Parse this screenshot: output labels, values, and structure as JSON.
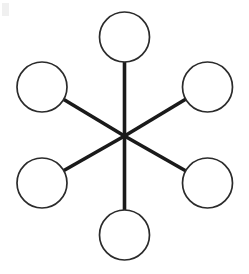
{
  "diagram": {
    "name": "hub-and-spoke-diagram",
    "type": "node-link",
    "canvas": {
      "width": 249,
      "height": 274,
      "background_color": "#ffffff"
    },
    "style": {
      "node_stroke_color": "#2b2b2b",
      "node_fill_color": "#ffffff",
      "node_stroke_width": 1.7,
      "edge_color": "#1a1a1a",
      "edge_width": 3.6,
      "hub_edge_width": 3.6
    },
    "hub": {
      "label": "",
      "name": "hub-center",
      "cx": 124.5,
      "cy": 136.0
    },
    "nodes": [
      {
        "id": "node-top",
        "label": "",
        "position": "top",
        "cx": 124.5,
        "cy": 37.0,
        "r": 25.0
      },
      {
        "id": "node-upper-right",
        "label": "",
        "position": "upper-right",
        "cx": 207.5,
        "cy": 87.0,
        "r": 25.0
      },
      {
        "id": "node-lower-right",
        "label": "",
        "position": "lower-right",
        "cx": 207.5,
        "cy": 183.0,
        "r": 25.0
      },
      {
        "id": "node-bottom",
        "label": "",
        "position": "bottom",
        "cx": 124.5,
        "cy": 235.0,
        "r": 25.0
      },
      {
        "id": "node-lower-left",
        "label": "",
        "position": "lower-left",
        "cx": 42.0,
        "cy": 183.0,
        "r": 25.0
      },
      {
        "id": "node-upper-left",
        "label": "",
        "position": "upper-left",
        "cx": 42.0,
        "cy": 87.0,
        "r": 25.0
      }
    ],
    "edges": [
      {
        "id": "edge-hub-top",
        "from": "hub-center",
        "to": "node-top",
        "x1": 124.5,
        "y1": 136.0,
        "x2": 124.5,
        "y2": 62.0
      },
      {
        "id": "edge-hub-upper-right",
        "from": "hub-center",
        "to": "node-upper-right",
        "x1": 124.5,
        "y1": 136.0,
        "x2": 186.0,
        "y2": 99.0
      },
      {
        "id": "edge-hub-lower-right",
        "from": "hub-center",
        "to": "node-lower-right",
        "x1": 124.5,
        "y1": 136.0,
        "x2": 186.0,
        "y2": 171.0
      },
      {
        "id": "edge-hub-bottom",
        "from": "hub-center",
        "to": "node-bottom",
        "x1": 124.5,
        "y1": 136.0,
        "x2": 124.5,
        "y2": 210.0
      },
      {
        "id": "edge-hub-lower-left",
        "from": "hub-center",
        "to": "node-lower-left",
        "x1": 124.5,
        "y1": 136.0,
        "x2": 63.0,
        "y2": 171.0
      },
      {
        "id": "edge-hub-upper-left",
        "from": "hub-center",
        "to": "node-upper-left",
        "x1": 124.5,
        "y1": 136.0,
        "x2": 63.0,
        "y2": 99.0
      }
    ],
    "artifacts": [
      {
        "id": "corner-smudge",
        "x": 2,
        "y": 3,
        "width": 7,
        "height": 13,
        "color": "#f0f0f0"
      }
    ]
  }
}
